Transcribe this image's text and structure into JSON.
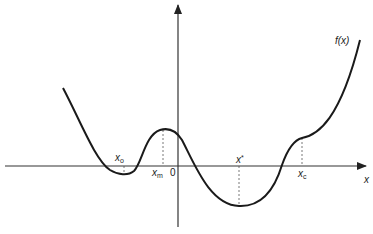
{
  "figure": {
    "curve_label": "f(x)",
    "x_axis_label": "x",
    "origin_label": "0",
    "points": {
      "x_o": {
        "base": "x",
        "sub": "o",
        "note": "local minimum left"
      },
      "x_m": {
        "base": "x",
        "sub": "m",
        "note": "local maximum"
      },
      "x_star": {
        "base": "x",
        "sup": "*",
        "note": "global minimum"
      },
      "x_c": {
        "base": "x",
        "sub": "c",
        "note": "inflection / saddle-like point"
      }
    },
    "colors": {
      "curve": "#1a1a1a",
      "axes": "#333333",
      "dashes": "#555555"
    }
  }
}
